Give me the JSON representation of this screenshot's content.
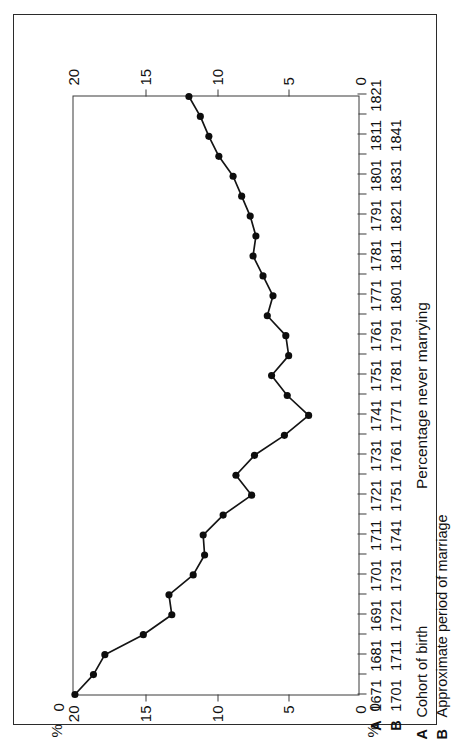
{
  "figure": {
    "percent_symbol": "%",
    "zero_label": "0",
    "y_axis": {
      "title": "Percentage never marrying",
      "unit": "%",
      "ticks": [
        0,
        5,
        10,
        15,
        20
      ],
      "tick_labels": [
        "0",
        "5",
        "10",
        "15",
        "20"
      ],
      "min": 0,
      "max": 20,
      "inverted": true
    },
    "legend": {
      "a_key": "A",
      "a_text": "Cohort of birth",
      "b_key": "B",
      "b_text": "Approximate period of marriage"
    },
    "x_axis": {
      "row_a_label": "A",
      "row_b_label": "B",
      "row_a_ticks": [
        "1671",
        "1681",
        "1691",
        "1701",
        "1711",
        "1721",
        "1731",
        "1741",
        "1751",
        "1761",
        "1771",
        "1781",
        "1791",
        "1801",
        "1811",
        "1821"
      ],
      "row_b_ticks": [
        "1701",
        "1711",
        "1721",
        "1731",
        "1741",
        "1751",
        "1761",
        "1771",
        "1781",
        "1791",
        "1801",
        "1811",
        "1821",
        "1831",
        "1841"
      ]
    }
  },
  "chart_data": {
    "type": "line",
    "title": "",
    "xlabel": "Cohort of birth / Approximate period of marriage",
    "ylabel": "Percentage never marrying",
    "unit": "%",
    "ylim": [
      0,
      20
    ],
    "y_inverted": true,
    "grid": false,
    "legend_position": "none",
    "marker": "filled-circle",
    "x_tick_years_cohort": [
      "1671",
      "1681",
      "1691",
      "1701",
      "1711",
      "1721",
      "1731",
      "1741",
      "1751",
      "1761",
      "1771",
      "1781",
      "1791",
      "1801",
      "1811",
      "1821"
    ],
    "x_tick_years_marriage": [
      "1701",
      "1711",
      "1721",
      "1731",
      "1741",
      "1751",
      "1761",
      "1771",
      "1781",
      "1791",
      "1801",
      "1811",
      "1821",
      "1831",
      "1841"
    ],
    "x_start_year": 1671,
    "x_end_year": 1821,
    "x_step_years": 5,
    "series": [
      {
        "name": "Percentage never marrying",
        "x": [
          1671,
          1676,
          1681,
          1686,
          1691,
          1696,
          1701,
          1706,
          1711,
          1716,
          1721,
          1726,
          1731,
          1736,
          1741,
          1746,
          1751,
          1756,
          1761,
          1766,
          1771,
          1776,
          1781,
          1786,
          1791,
          1796,
          1801,
          1806,
          1811,
          1816,
          1821
        ],
        "values": [
          19.9,
          18.6,
          17.8,
          15.1,
          13.1,
          13.3,
          11.6,
          10.8,
          10.9,
          9.5,
          7.5,
          8.6,
          7.3,
          5.2,
          3.5,
          5.0,
          6.1,
          4.9,
          5.1,
          6.4,
          6.0,
          6.7,
          7.4,
          7.2,
          7.6,
          8.2,
          8.8,
          9.8,
          10.5,
          11.1,
          11.9
        ]
      }
    ]
  }
}
